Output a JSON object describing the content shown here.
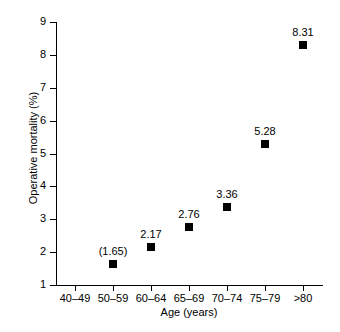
{
  "chart_data": {
    "type": "scatter",
    "title": "",
    "xlabel": "Age (years)",
    "ylabel": "Operative mortality (%)",
    "categories": [
      "40–49",
      "50–59",
      "60–64",
      "65–69",
      "70–74",
      "75–79",
      ">80"
    ],
    "values": [
      null,
      1.65,
      2.17,
      2.76,
      3.36,
      5.28,
      8.31
    ],
    "point_labels": [
      "",
      "(1.65)",
      "2.17",
      "2.76",
      "3.36",
      "5.28",
      "8.31"
    ],
    "ylim": [
      1,
      9
    ],
    "y_ticks": [
      1,
      2,
      3,
      4,
      5,
      6,
      7,
      8,
      9
    ],
    "y_tick_labels": [
      "1",
      "2",
      "3",
      "4",
      "5",
      "6",
      "7",
      "8",
      "9"
    ],
    "grid": false,
    "legend": "none",
    "marker": "filled-square",
    "marker_color": "#000000",
    "series": [
      {
        "name": "Operative mortality",
        "values": [
          null,
          1.65,
          2.17,
          2.76,
          3.36,
          5.28,
          8.31
        ]
      }
    ]
  },
  "axes": {
    "y_title": "Operative mortality (%)",
    "x_title": "Age (years)"
  }
}
